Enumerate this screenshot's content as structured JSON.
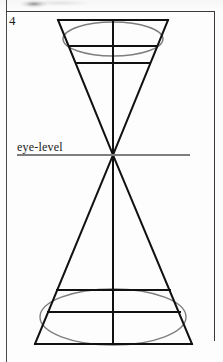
{
  "page": {
    "figure_number": "4",
    "eye_level_label": "eye-level"
  },
  "colors": {
    "ink": "#111111",
    "construction_line": "#7e7e7e",
    "frame": "#3a3a3a",
    "paper": "#fdfdfd"
  },
  "figure": {
    "type": "two-point-perspective-cone-construction",
    "vanishing_point": {
      "x": 113,
      "y": 155
    },
    "eye_level_line": {
      "x1": 17,
      "y1": 155,
      "x2": 190,
      "y2": 155,
      "color": "#7e7e7e",
      "width": 2
    },
    "upper_cone": {
      "top_edge": {
        "x1": 58,
        "y1": 20,
        "x2": 168,
        "y2": 20
      },
      "left_edge": {
        "x1": 58,
        "y1": 20,
        "x2": 113,
        "y2": 155
      },
      "right_edge": {
        "x1": 168,
        "y1": 20,
        "x2": 113,
        "y2": 155
      },
      "center_axis": {
        "x1": 113,
        "y1": 20,
        "x2": 113,
        "y2": 155
      },
      "horizontal_lines": [
        {
          "y": 46,
          "x1": 69,
          "x2": 157
        },
        {
          "y": 63,
          "x1": 76,
          "x2": 150
        }
      ],
      "ellipse": {
        "cx": 113,
        "cy": 39,
        "rx": 50,
        "ry": 17,
        "color": "#7e7e7e"
      }
    },
    "lower_cone": {
      "bottom_edge": {
        "x1": 35,
        "y1": 344,
        "x2": 192,
        "y2": 344
      },
      "left_edge": {
        "x1": 35,
        "y1": 344,
        "x2": 113,
        "y2": 155
      },
      "right_edge": {
        "x1": 192,
        "y1": 344,
        "x2": 113,
        "y2": 155
      },
      "center_axis": {
        "x1": 113,
        "y1": 155,
        "x2": 113,
        "y2": 344
      },
      "horizontal_lines": [
        {
          "y": 290,
          "x1": 57,
          "x2": 170
        },
        {
          "y": 312,
          "x1": 48,
          "x2": 180
        }
      ],
      "ellipse": {
        "cx": 113,
        "cy": 317,
        "rx": 73,
        "ry": 28,
        "color": "#7e7e7e"
      }
    }
  }
}
